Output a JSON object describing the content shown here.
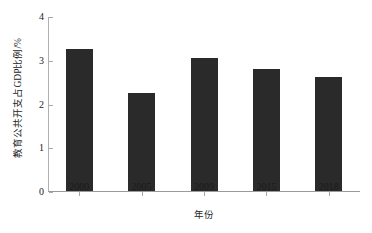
{
  "chart_data": {
    "type": "bar",
    "title": "",
    "subtitle": "",
    "xlabel": "年份",
    "ylabel": "教育公共开支占GDP比例/%",
    "categories": [
      "2000",
      "2005",
      "2009",
      "2015",
      "2018"
    ],
    "values": [
      3.24,
      2.24,
      3.05,
      2.79,
      2.61
    ],
    "series": [
      {
        "name": "教育公共开支占GDP比例",
        "values": [
          3.24,
          2.24,
          3.05,
          2.79,
          2.61
        ]
      }
    ],
    "ylim": [
      0,
      4
    ],
    "yticks": [
      "0",
      "1",
      "2",
      "3",
      "4"
    ],
    "ytick_values": [
      0,
      1,
      2,
      3,
      4
    ],
    "xticks": [
      "2000",
      "2005",
      "2009",
      "2015",
      "2018"
    ],
    "grid": false,
    "legend": false,
    "legend_position": "none",
    "bar_color": "#2a2a2a",
    "axis_color": "#9a9a9a",
    "background_color": "#ffffff",
    "annotations": []
  }
}
